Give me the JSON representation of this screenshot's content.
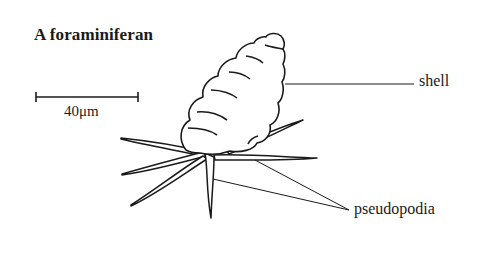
{
  "title": "A foraminiferan",
  "scale_bar": {
    "label": "40μm",
    "length_px": 102
  },
  "labels": {
    "shell": "shell",
    "pseudopodia": "pseudopodia"
  },
  "colors": {
    "ink": "#1a1a1a",
    "background": "#ffffff"
  }
}
